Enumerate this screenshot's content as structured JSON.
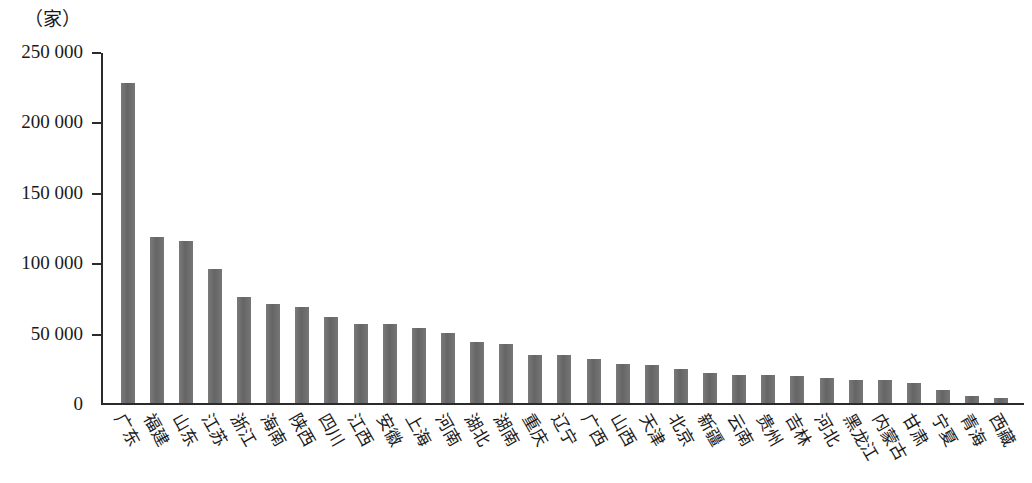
{
  "figure": {
    "y_unit_caption": "（家）"
  },
  "chart_data": {
    "type": "bar",
    "title": "",
    "subtitle": "",
    "xlabel": "",
    "ylabel": "（家）",
    "ylim": [
      0,
      250000
    ],
    "yticks": [
      0,
      50000,
      100000,
      150000,
      200000,
      250000
    ],
    "ytick_labels": [
      "0",
      "50 000",
      "100 000",
      "150 000",
      "200 000",
      "250 000"
    ],
    "grid": false,
    "legend": "none",
    "bar_color": "#6e6e6e",
    "axis_color": "#2b2b2b",
    "categories": [
      "广东",
      "福建",
      "山东",
      "江苏",
      "浙江",
      "海南",
      "陕西",
      "四川",
      "江西",
      "安徽",
      "上海",
      "河南",
      "湖北",
      "湖南",
      "重庆",
      "辽宁",
      "广西",
      "山西",
      "天津",
      "北京",
      "新疆",
      "云南",
      "贵州",
      "吉林",
      "河北",
      "黑龙江",
      "内蒙古",
      "甘肃",
      "宁夏",
      "青海",
      "西藏"
    ],
    "values": [
      227000,
      118000,
      115000,
      95000,
      75000,
      70000,
      68000,
      61000,
      56000,
      56000,
      53000,
      50000,
      43000,
      42000,
      34000,
      34000,
      31000,
      28000,
      27000,
      24000,
      21000,
      20000,
      20000,
      19000,
      18000,
      16000,
      16000,
      14000,
      9000,
      5000,
      3500
    ]
  }
}
